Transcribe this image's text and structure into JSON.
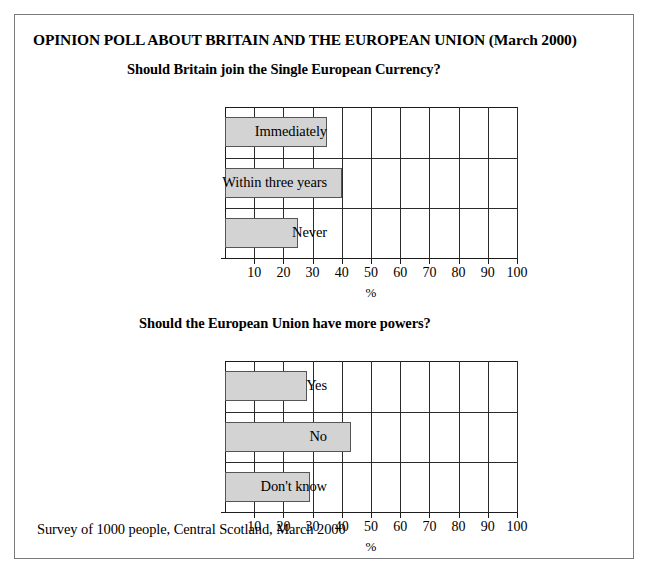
{
  "poster": {
    "title": "OPINION POLL ABOUT BRITAIN AND THE EUROPEAN UNION (March 2000)",
    "footer": "Survey of 1000 people, Central Scotland, March 2000",
    "bar_fill_color": "#d3d3d3",
    "bar_border_color": "#555555",
    "grid_color": "#2b2b2b",
    "border_color": "#7a7a7a"
  },
  "chart_data": [
    {
      "type": "bar",
      "orientation": "horizontal",
      "title": "Should Britain join the Single European Currency?",
      "categories": [
        "Immediately",
        "Within three years",
        "Never"
      ],
      "values": [
        35,
        40,
        25
      ],
      "xlabel": "%",
      "ylabel": "",
      "xlim": [
        0,
        100
      ],
      "xticks": [
        10,
        20,
        30,
        40,
        50,
        60,
        70,
        80,
        90,
        100
      ],
      "grid": true,
      "legend": "none"
    },
    {
      "type": "bar",
      "orientation": "horizontal",
      "title": "Should the European Union have more powers?",
      "categories": [
        "Yes",
        "No",
        "Don't know"
      ],
      "values": [
        28,
        43,
        29
      ],
      "xlabel": "%",
      "ylabel": "",
      "xlim": [
        0,
        100
      ],
      "xticks": [
        10,
        20,
        30,
        40,
        50,
        60,
        70,
        80,
        90,
        100
      ],
      "grid": true,
      "legend": "none"
    }
  ]
}
